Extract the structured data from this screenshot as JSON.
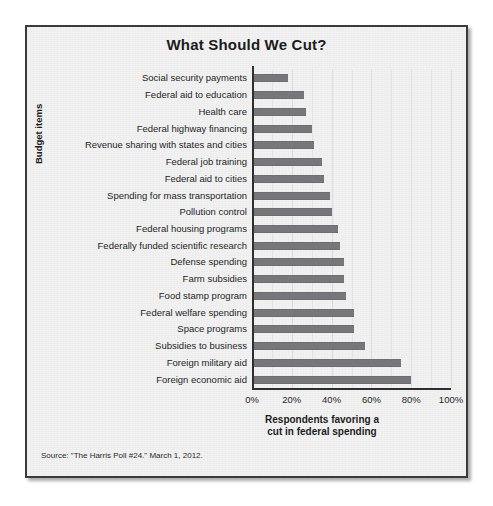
{
  "figure": {
    "title": "What Should We Cut?",
    "source": "Source: \"The Harris Poll #24.\" March 1, 2012."
  },
  "axes": {
    "ylabel": "Budget items",
    "xlabel_line1": "Respondents favoring a",
    "xlabel_line2": "cut in federal spending",
    "xticks": [
      "0%",
      "20%",
      "40%",
      "60%",
      "80%",
      "100%"
    ]
  },
  "colors": {
    "bar": "#77777a",
    "frame": "#3b3b3b",
    "plot_background": "#f2f2f2",
    "gridline": "#e3e3e3",
    "axis": "#2e2e2e",
    "text": "#1c1c1c"
  },
  "chart_data": {
    "type": "bar",
    "orientation": "horizontal",
    "title": "What Should We Cut?",
    "xlabel": "Respondents favoring a cut in federal spending",
    "ylabel": "Budget items",
    "xlim": [
      0,
      100
    ],
    "xtick_values": [
      0,
      20,
      40,
      60,
      80,
      100
    ],
    "xtick_labels": [
      "0%",
      "20%",
      "40%",
      "60%",
      "80%",
      "100%"
    ],
    "grid": true,
    "legend": false,
    "units": "percent",
    "categories": [
      "Social security payments",
      "Federal aid to education",
      "Health care",
      "Federal highway financing",
      "Revenue sharing with states and cities",
      "Federal job training",
      "Federal aid to cities",
      "Spending for mass transportation",
      "Pollution control",
      "Federal housing programs",
      "Federally funded scientific research",
      "Defense spending",
      "Farm subsidies",
      "Food stamp program",
      "Federal welfare spending",
      "Space programs",
      "Subsidies to business",
      "Foreign military aid",
      "Foreign economic aid"
    ],
    "values": [
      17,
      25,
      26,
      29,
      30,
      34,
      35,
      38,
      39,
      42,
      43,
      45,
      45,
      46,
      50,
      50,
      56,
      74,
      79
    ]
  }
}
